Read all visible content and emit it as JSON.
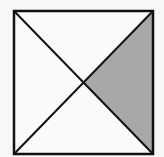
{
  "diagram": {
    "square": {
      "x": 14,
      "y": 11,
      "width": 139,
      "height": 143
    },
    "center": {
      "x": 84,
      "y": 83
    },
    "shaded_region": "right",
    "colors": {
      "stroke": "#111111",
      "fill_shaded": "#a8a8a8",
      "fill_unshaded": "#fafafa"
    }
  }
}
